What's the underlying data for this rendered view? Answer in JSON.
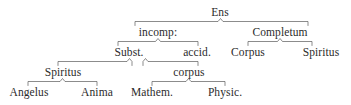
{
  "diagram": {
    "type": "tree",
    "orientation": "top-down",
    "style": "brace-connectors",
    "text_color": "#2b2b2b",
    "line_color": "#5a5a5a",
    "background_color": "#ffffff",
    "root": "Ens",
    "levels": [
      {
        "level": 1,
        "nodes": [
          "Ens"
        ]
      },
      {
        "level": 2,
        "nodes": [
          "incomp:",
          "Completum"
        ]
      },
      {
        "level": 3,
        "nodes": [
          "Subst.",
          "accid.",
          "Corpus",
          "Spiritus"
        ]
      },
      {
        "level": 4,
        "nodes": [
          "Spiritus",
          "corpus"
        ]
      },
      {
        "level": 5,
        "nodes": [
          "Angelus",
          "Anima",
          "Mathem.",
          "Physic."
        ]
      }
    ],
    "edges": [
      {
        "parent": "Ens",
        "children": [
          "incomp:",
          "Completum"
        ]
      },
      {
        "parent": "incomp:",
        "children": [
          "Subst.",
          "accid."
        ]
      },
      {
        "parent": "Completum",
        "children": [
          "Corpus",
          "Spiritus"
        ]
      },
      {
        "parent": "Subst.",
        "children": [
          "Spiritus"
        ]
      },
      {
        "parent": "accid.",
        "children": [
          "corpus"
        ]
      },
      {
        "parent": "Spiritus",
        "children": [
          "Angelus",
          "Anima"
        ]
      },
      {
        "parent": "corpus",
        "children": [
          "Mathem.",
          "Physic."
        ]
      }
    ],
    "nodes": {
      "ens": "Ens",
      "incomp": "incomp:",
      "completum": "Completum",
      "subst": "Subst.",
      "accid": "accid.",
      "corpus_upper": "Corpus",
      "spiritus_upper": "Spiritus",
      "spiritus_lower": "Spiritus",
      "corpus_lower": "corpus",
      "angelus": "Angelus",
      "anima": "Anima",
      "mathem": "Mathem.",
      "physic": "Physic."
    }
  }
}
